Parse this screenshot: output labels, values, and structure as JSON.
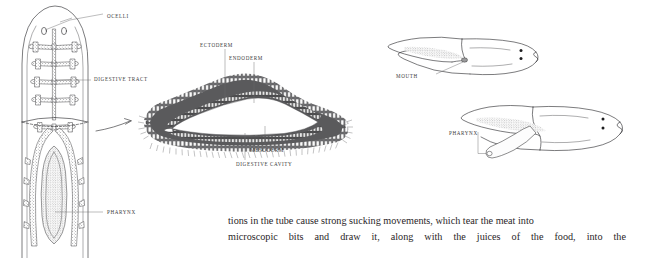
{
  "figure": {
    "caption_text": {
      "line1": "tions in the tube cause strong sucking movements, which tear the meat into",
      "line2_words": [
        "microscopic",
        "bits",
        "and",
        "draw",
        "it,",
        "along",
        "with",
        "the",
        "juices",
        "of",
        "the",
        "food,",
        "into",
        "the"
      ]
    },
    "panels": {
      "whole_animal": {
        "name": "planarian-dorsal-view",
        "labels": [
          {
            "id": "ocelli",
            "text": "OCELLI",
            "x": 107,
            "y": 16
          },
          {
            "id": "digestive-tract",
            "text": "DIGESTIVE TRACT",
            "x": 94,
            "y": 79
          },
          {
            "id": "pharynx",
            "text": "PHARYNX",
            "x": 107,
            "y": 212
          }
        ]
      },
      "cross_section": {
        "name": "planarian-cross-section",
        "labels": [
          {
            "id": "ectoderm",
            "text": "ECTODERM",
            "x": 200,
            "y": 46
          },
          {
            "id": "endoderm",
            "text": "ENDODERM",
            "x": 229,
            "y": 59
          },
          {
            "id": "mesoderm",
            "text": "MESODERM",
            "x": 250,
            "y": 150
          },
          {
            "id": "digestive-cavity",
            "text": "DIGESTIVE CAVITY",
            "x": 236,
            "y": 164
          }
        ]
      },
      "side_views": {
        "name": "planarian-side-views",
        "labels": [
          {
            "id": "mouth",
            "text": "MOUTH",
            "x": 396,
            "y": 76
          },
          {
            "id": "pharynx",
            "text": "PHARYNX",
            "x": 449,
            "y": 133
          }
        ]
      }
    },
    "colors": {
      "background": "#ffffff",
      "ink": "#2b2b2d",
      "label_text": "#3a3a3c",
      "leader_line": "#6b6b6d",
      "tissue_fill": "#4a4a4c",
      "body_text": "#2a2628"
    }
  }
}
